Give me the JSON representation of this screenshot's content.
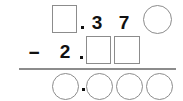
{
  "problem": {
    "type": "vertical-subtraction-worksheet",
    "operator": "−",
    "decimal_separator": ".",
    "minuend": {
      "label": "minuend-row",
      "cells": [
        {
          "kind": "box",
          "value": ""
        },
        {
          "kind": "separator",
          "value": "."
        },
        {
          "kind": "digit",
          "value": "3"
        },
        {
          "kind": "digit",
          "value": "7"
        },
        {
          "kind": "circle",
          "value": ""
        }
      ],
      "text": "_ . 3 7 O"
    },
    "subtrahend": {
      "label": "subtrahend-row",
      "cells": [
        {
          "kind": "digit",
          "value": "2"
        },
        {
          "kind": "separator",
          "value": "."
        },
        {
          "kind": "box",
          "value": ""
        },
        {
          "kind": "box",
          "value": ""
        }
      ],
      "text": "2 . _ _"
    },
    "answer": {
      "label": "answer-row",
      "cells": [
        {
          "kind": "circle",
          "value": ""
        },
        {
          "kind": "separator",
          "value": "."
        },
        {
          "kind": "circle",
          "value": ""
        },
        {
          "kind": "circle",
          "value": ""
        },
        {
          "kind": "circle",
          "value": ""
        }
      ],
      "text": "O . O O O"
    }
  },
  "colors": {
    "outline": "#8c8c8c",
    "ink": "#111111",
    "background": "#ffffff"
  }
}
